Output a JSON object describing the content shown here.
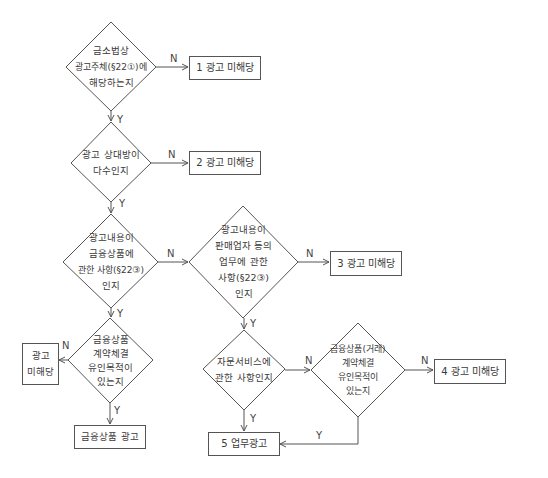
{
  "decisions": [
    {
      "id": "d1",
      "lines": [
        "금소법상",
        "광고주체(§22①)에",
        "해당하는지"
      ]
    },
    {
      "id": "d2",
      "lines": [
        "광고 상대방이",
        "다수인지"
      ]
    },
    {
      "id": "d3",
      "lines": [
        "광고내용이",
        "금융상품에",
        "관한 사항(§22③)",
        "인지"
      ]
    },
    {
      "id": "d4",
      "lines": [
        "광고내용이",
        "판매업자 등의",
        "업무에 관한",
        "사항(§22③)",
        "인지"
      ]
    },
    {
      "id": "d5",
      "lines": [
        "금융상품",
        "계약체결",
        "유인목적이",
        "있는지"
      ]
    },
    {
      "id": "d6",
      "lines": [
        "자문서비스에",
        "관한 사항인지"
      ]
    },
    {
      "id": "d7",
      "lines": [
        "금융상품(거래)",
        "계약체결",
        "유인목적이",
        "있는지"
      ]
    }
  ],
  "outcomes": {
    "o1": "1 광고 미해당",
    "o2": "2 광고 미해당",
    "o3": "3 광고 미해당",
    "o4": "4 광고 미해당",
    "o5": "5 업무광고",
    "left_not_ad_line1": "광고",
    "left_not_ad_line2": "미해당",
    "financial_product_ad": "금융상품 광고"
  },
  "edge_labels": {
    "yes": "Y",
    "no": "N"
  },
  "colors": {
    "line": "#555555",
    "text": "#3a3a3a",
    "background": "#ffffff"
  }
}
